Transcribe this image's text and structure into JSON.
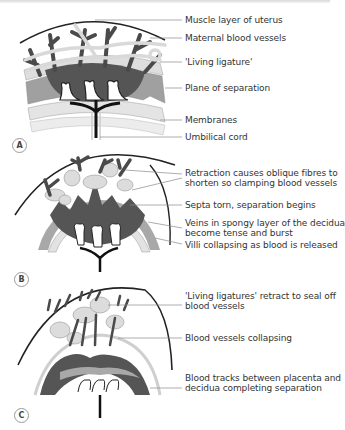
{
  "figure": {
    "panels": [
      {
        "id": "A",
        "tag": "A",
        "labels": [
          "Muscle layer of uterus",
          "Maternal blood vessels",
          "'Living ligature'",
          "Plane of separation",
          "Membranes",
          "Umbilical cord"
        ]
      },
      {
        "id": "B",
        "tag": "B",
        "labels": [
          "Retraction causes oblique fibres to",
          "shorten so clamping blood vessels",
          "Septa torn, separation begins",
          "Veins in spongy layer of the decidua",
          "become tense and burst",
          "Villi collapsing as blood is released"
        ]
      },
      {
        "id": "C",
        "tag": "C",
        "labels": [
          "'Living ligatures' retract to seal off",
          "blood vessels",
          "Blood vessels collapsing",
          "Blood tracks between placenta and",
          "decidua completing separation"
        ]
      }
    ],
    "colors": {
      "vessel_dark": "#4a4a4a",
      "blood_pool": "#555555",
      "ligature_light": "#d9d9d9",
      "layer_mid": "#a8a8a8",
      "layer_light": "#e2e2e2",
      "cord": "#111111",
      "leader_line": "#8a8a8a"
    }
  }
}
